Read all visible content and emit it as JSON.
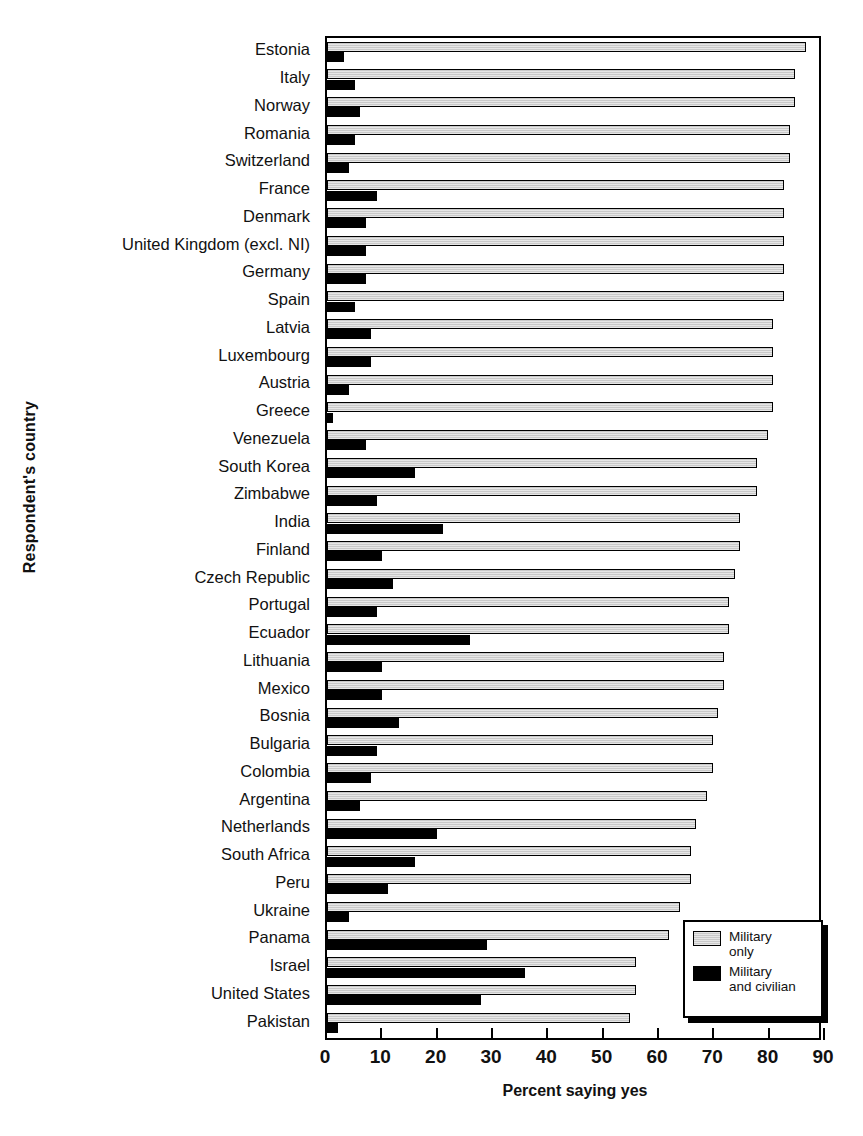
{
  "chart_data": {
    "type": "bar",
    "orientation": "horizontal",
    "title": "",
    "xlabel": "Percent saying yes",
    "ylabel": "Respondent's country",
    "xlim": [
      0,
      90
    ],
    "xticks": [
      0,
      10,
      20,
      30,
      40,
      50,
      60,
      70,
      80,
      90
    ],
    "grid": false,
    "legend_position": "bottom-right",
    "categories": [
      "Estonia",
      "Italy",
      "Norway",
      "Romania",
      "Switzerland",
      "France",
      "Denmark",
      "United Kingdom (excl. NI)",
      "Germany",
      "Spain",
      "Latvia",
      "Luxembourg",
      "Austria",
      "Greece",
      "Venezuela",
      "South Korea",
      "Zimbabwe",
      "India",
      "Finland",
      "Czech Republic",
      "Portugal",
      "Ecuador",
      "Lithuania",
      "Mexico",
      "Bosnia",
      "Bulgaria",
      "Colombia",
      "Argentina",
      "Netherlands",
      "South Africa",
      "Peru",
      "Ukraine",
      "Panama",
      "Israel",
      "United States",
      "Pakistan"
    ],
    "series": [
      {
        "name": "Military only",
        "color": "#c9c9c9",
        "values": [
          87,
          85,
          85,
          84,
          84,
          83,
          83,
          83,
          83,
          83,
          81,
          81,
          81,
          81,
          80,
          78,
          78,
          75,
          75,
          74,
          73,
          73,
          72,
          72,
          71,
          70,
          70,
          69,
          67,
          66,
          66,
          64,
          62,
          56,
          56,
          55
        ]
      },
      {
        "name": "Military and civilian",
        "color": "#000000",
        "values": [
          3,
          5,
          6,
          5,
          4,
          9,
          7,
          7,
          7,
          5,
          8,
          8,
          4,
          1,
          7,
          16,
          9,
          21,
          10,
          12,
          9,
          26,
          10,
          10,
          13,
          9,
          8,
          6,
          20,
          16,
          11,
          4,
          29,
          36,
          28,
          2
        ]
      }
    ]
  },
  "legend": {
    "items": [
      {
        "label_line1": "Military",
        "label_line2": "only"
      },
      {
        "label_line1": "Military",
        "label_line2": "and civilian"
      }
    ]
  },
  "axis": {
    "x_tick_labels": [
      "0",
      "10",
      "20",
      "30",
      "40",
      "50",
      "60",
      "70",
      "80",
      "90"
    ],
    "x_title": "Percent saying yes",
    "y_title": "Respondent's country"
  }
}
